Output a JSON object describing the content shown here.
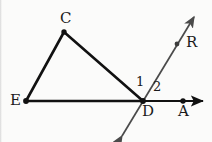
{
  "figure": {
    "background_color": "#fbfbfa",
    "stroke_color_primary": "#111111",
    "stroke_color_secondary": "#4a4a4a",
    "width": 212,
    "height": 142
  },
  "points": [
    {
      "id": "C",
      "label": "C",
      "x": 64,
      "y": 32,
      "label_x": 60,
      "label_y": 11,
      "dot": true
    },
    {
      "id": "E",
      "label": "E",
      "x": 26,
      "y": 101,
      "label_x": 10,
      "label_y": 93,
      "dot": true
    },
    {
      "id": "D",
      "label": "D",
      "x": 143,
      "y": 101,
      "label_x": 142,
      "label_y": 104,
      "dot": true
    },
    {
      "id": "A",
      "label": "A",
      "x": 183,
      "y": 101,
      "label_x": 178,
      "label_y": 104,
      "dot": true
    },
    {
      "id": "R",
      "label": "R",
      "x": 177,
      "y": 44,
      "label_x": 186,
      "label_y": 35,
      "dot": true
    }
  ],
  "angles": [
    {
      "id": "angle-1",
      "label": "1",
      "label_x": 136,
      "label_y": 75
    },
    {
      "id": "angle-2",
      "label": "2",
      "label_x": 153,
      "label_y": 80
    }
  ],
  "segments": [
    {
      "id": "segment-EC",
      "from": "E",
      "to": "C",
      "x1": 26,
      "y1": 101,
      "x2": 64,
      "y2": 32,
      "width": 2.6,
      "color": "#111111"
    },
    {
      "id": "segment-CD",
      "from": "C",
      "to": "D",
      "x1": 64,
      "y1": 32,
      "x2": 143,
      "y2": 101,
      "width": 2.6,
      "color": "#111111"
    },
    {
      "id": "segment-ED",
      "from": "E",
      "to": "D",
      "x1": 26,
      "y1": 101,
      "x2": 143,
      "y2": 101,
      "width": 2.6,
      "color": "#111111"
    }
  ],
  "rays": [
    {
      "id": "ray-DA",
      "label": "ray D to A",
      "x1": 143,
      "y1": 101,
      "x2": 205,
      "y2": 101,
      "width": 2.2,
      "color": "#111111",
      "arrow_end": true,
      "arrow_start": false
    }
  ],
  "lines": [
    {
      "id": "line-R",
      "label": "line through D and R",
      "x1": 122,
      "y1": 136,
      "x2": 194,
      "y2": 17,
      "width": 1.7,
      "color": "#4a4a4a",
      "arrow_end": true,
      "arrow_start": true
    }
  ]
}
